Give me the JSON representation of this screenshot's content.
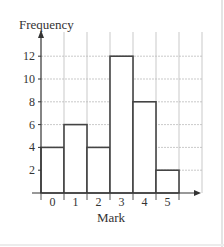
{
  "chart_data": {
    "type": "bar",
    "subtype": "histogram",
    "title": "",
    "xlabel": "Mark",
    "ylabel": "Frequency",
    "categories": [
      "0",
      "1",
      "2",
      "3",
      "4",
      "5"
    ],
    "values": [
      4,
      6,
      4,
      12,
      8,
      2
    ],
    "yticks": [
      2,
      4,
      6,
      8,
      10,
      12
    ],
    "ylim": [
      0,
      13
    ],
    "grid": true,
    "legend": null,
    "bar_fill": "#ffffff",
    "bar_stroke": "#444444",
    "grid_color": "#bbbbbb"
  }
}
